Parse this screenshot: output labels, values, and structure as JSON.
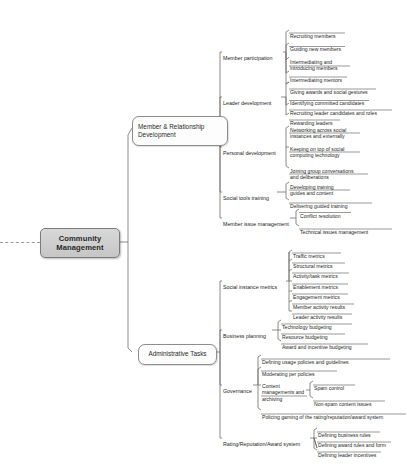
{
  "diagram": {
    "type": "mind-map",
    "title": "Community Management",
    "root": {
      "label": "Community\nManagement"
    },
    "branches": [
      {
        "id": "member-relationship-development",
        "label": "Member & Relationship\nDevelopment",
        "children": [
          {
            "label": "Member participation",
            "children": [
              {
                "label": "Recruiting members"
              },
              {
                "label": "Guiding new members"
              },
              {
                "label": "Intermediating and\nintroducing members"
              },
              {
                "label": "Intermediating mentors"
              },
              {
                "label": "Giving awards and social gestures"
              }
            ]
          },
          {
            "label": "Leader development",
            "children": [
              {
                "label": "Identifying committed candidates"
              },
              {
                "label": "Recruiting leader candidates and roles"
              },
              {
                "label": "Rewarding leaders"
              }
            ]
          },
          {
            "label": "Personal development",
            "children": [
              {
                "label": "Networking across social\ninstances and externally"
              },
              {
                "label": "Keeping on top of social\ncomputing technology"
              },
              {
                "label": "Joining group conversations\nand deliberations"
              }
            ]
          },
          {
            "label": "Social tools training",
            "children": [
              {
                "label": "Developing training\nguides and content"
              },
              {
                "label": "Delivering guided training"
              }
            ]
          },
          {
            "label": "Member issue management",
            "children": [
              {
                "label": "Conflict resolution"
              },
              {
                "label": "Technical issues management"
              }
            ]
          }
        ]
      },
      {
        "id": "administrative-tasks",
        "label": "Administrative Tasks",
        "children": [
          {
            "label": "Social instance metrics",
            "children": [
              {
                "label": "Traffic metrics"
              },
              {
                "label": "Structural metrics"
              },
              {
                "label": "Activity/task metrics"
              },
              {
                "label": "Enablement metrics"
              },
              {
                "label": "Engagement metrics"
              },
              {
                "label": "Member activity results"
              },
              {
                "label": "Leader activity results"
              }
            ]
          },
          {
            "label": "Business planning",
            "children": [
              {
                "label": "Technology budgeting"
              },
              {
                "label": "Resource budgeting"
              },
              {
                "label": "Award and incentive budgeting"
              }
            ]
          },
          {
            "label": "Governance",
            "children": [
              {
                "label": "Defining usage policies and guidelines"
              },
              {
                "label": "Moderating per policies"
              },
              {
                "label": "Content\nmanagements and\narchiving",
                "children": [
                  {
                    "label": "Spam control"
                  },
                  {
                    "label": "Non-spam content issues"
                  }
                ]
              },
              {
                "label": "Policing gaming of the rating/reputation/award system"
              }
            ]
          },
          {
            "label": "Rating/Reputation/Award system",
            "children": [
              {
                "label": "Defining business rules"
              },
              {
                "label": "Defining award rules and form"
              },
              {
                "label": "Defining leader incentives"
              }
            ]
          }
        ]
      }
    ]
  },
  "colors": {
    "root_fill": "#ceced0",
    "root_border": "#7b7b7b",
    "line": "#6f6f6f",
    "text": "#1e1e1e"
  }
}
